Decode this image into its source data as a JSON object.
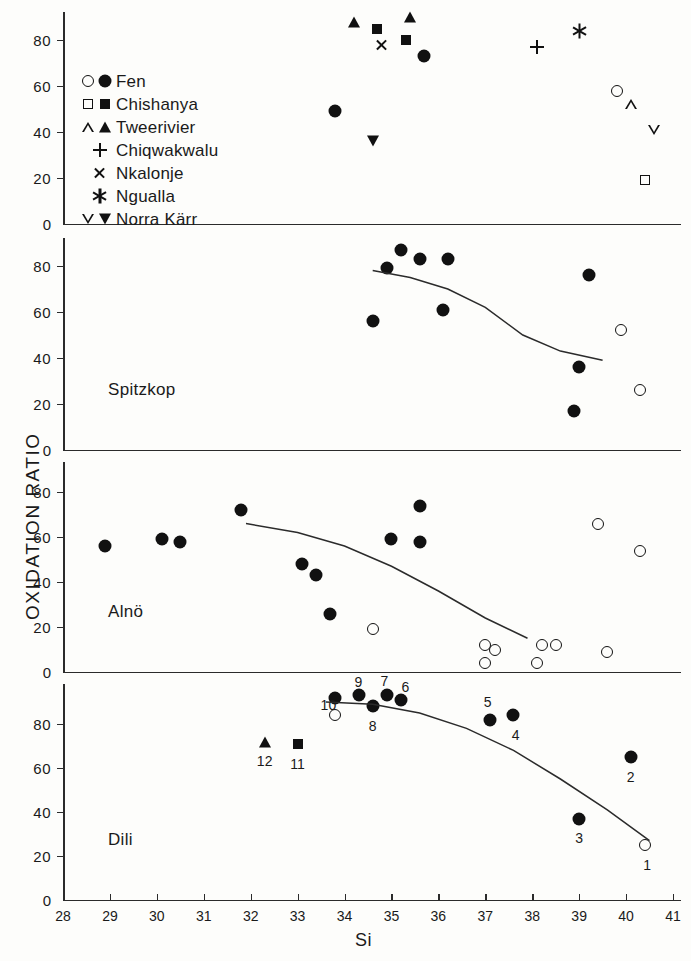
{
  "figure": {
    "axis_title_y": "OXIDATION  RATIO",
    "axis_title_x": "Si"
  },
  "legend": {
    "items": [
      {
        "label": "Fen",
        "markers": [
          "circle-open",
          "circle-filled"
        ]
      },
      {
        "label": "Chishanya",
        "markers": [
          "square-open",
          "square-filled"
        ]
      },
      {
        "label": "Tweerivier",
        "markers": [
          "triangle-open",
          "triangle-filled"
        ]
      },
      {
        "label": "Chiqwakwalu",
        "markers": [
          "plus"
        ]
      },
      {
        "label": "Nkalonje",
        "markers": [
          "x-cross"
        ]
      },
      {
        "label": "Ngualla",
        "markers": [
          "asterisk"
        ]
      },
      {
        "label": "Norra Kärr",
        "markers": [
          "dtriangle-open",
          "dtriangle-filled"
        ]
      }
    ]
  },
  "axes": {
    "x_ticks": [
      28,
      29,
      30,
      31,
      32,
      33,
      34,
      35,
      36,
      37,
      38,
      39,
      40,
      41
    ],
    "y_ticks": [
      0,
      20,
      40,
      60,
      80
    ],
    "xlim": [
      28,
      41
    ],
    "ylim": [
      0,
      95
    ]
  },
  "chart_data": {
    "type": "scatter",
    "title": "",
    "xlabel": "Si",
    "ylabel": "OXIDATION  RATIO",
    "xlim": [
      28,
      41
    ],
    "ylim": [
      0,
      95
    ],
    "grid": false,
    "legend_position": "top-left-panel",
    "panels": [
      {
        "name": "legend-panel",
        "label": "",
        "trend_curve": false,
        "points": [
          {
            "x": 34.2,
            "y": 88,
            "marker": "triangle-filled",
            "series": "Tweerivier"
          },
          {
            "x": 35.4,
            "y": 90,
            "marker": "triangle-filled",
            "series": "Tweerivier"
          },
          {
            "x": 34.7,
            "y": 85,
            "marker": "square-filled",
            "series": "Chishanya"
          },
          {
            "x": 35.3,
            "y": 80,
            "marker": "square-filled",
            "series": "Chishanya"
          },
          {
            "x": 34.8,
            "y": 78,
            "marker": "x-cross",
            "series": "Nkalonje"
          },
          {
            "x": 35.7,
            "y": 73,
            "marker": "circle-filled",
            "series": "Fen"
          },
          {
            "x": 33.8,
            "y": 49,
            "marker": "circle-filled",
            "series": "Fen"
          },
          {
            "x": 34.6,
            "y": 36,
            "marker": "dtriangle-filled",
            "series": "Norra Kärr"
          },
          {
            "x": 38.1,
            "y": 77,
            "marker": "plus",
            "series": "Chiqwakwalu"
          },
          {
            "x": 39.0,
            "y": 84,
            "marker": "asterisk",
            "series": "Ngualla"
          },
          {
            "x": 39.8,
            "y": 58,
            "marker": "circle-open",
            "series": "Fen"
          },
          {
            "x": 40.1,
            "y": 52,
            "marker": "triangle-open",
            "series": "Tweerivier"
          },
          {
            "x": 40.6,
            "y": 41,
            "marker": "dtriangle-open",
            "series": "Norra Kärr"
          },
          {
            "x": 40.4,
            "y": 19,
            "marker": "square-open",
            "series": "Chishanya"
          }
        ]
      },
      {
        "name": "spitzkop",
        "label": "Spitzkop",
        "trend_curve": true,
        "points": [
          {
            "x": 35.2,
            "y": 87,
            "marker": "circle-filled",
            "series": "Fen"
          },
          {
            "x": 35.6,
            "y": 83,
            "marker": "circle-filled",
            "series": "Fen"
          },
          {
            "x": 36.2,
            "y": 83,
            "marker": "circle-filled",
            "series": "Fen"
          },
          {
            "x": 34.9,
            "y": 79,
            "marker": "circle-filled",
            "series": "Fen"
          },
          {
            "x": 39.2,
            "y": 76,
            "marker": "circle-filled",
            "series": "Fen"
          },
          {
            "x": 36.1,
            "y": 61,
            "marker": "circle-filled",
            "series": "Fen"
          },
          {
            "x": 34.6,
            "y": 56,
            "marker": "circle-filled",
            "series": "Fen"
          },
          {
            "x": 39.9,
            "y": 52,
            "marker": "circle-open",
            "series": "Fen"
          },
          {
            "x": 39.0,
            "y": 36,
            "marker": "circle-filled",
            "series": "Fen"
          },
          {
            "x": 40.3,
            "y": 26,
            "marker": "circle-open",
            "series": "Fen"
          },
          {
            "x": 38.9,
            "y": 17,
            "marker": "circle-filled",
            "series": "Fen"
          }
        ]
      },
      {
        "name": "alno",
        "label": "Alnö",
        "trend_curve": true,
        "points": [
          {
            "x": 31.8,
            "y": 72,
            "marker": "circle-filled",
            "series": "Fen"
          },
          {
            "x": 35.6,
            "y": 74,
            "marker": "circle-filled",
            "series": "Fen"
          },
          {
            "x": 39.4,
            "y": 66,
            "marker": "circle-open",
            "series": "Fen"
          },
          {
            "x": 28.9,
            "y": 56,
            "marker": "circle-filled",
            "series": "Fen"
          },
          {
            "x": 30.1,
            "y": 59,
            "marker": "circle-filled",
            "series": "Fen"
          },
          {
            "x": 30.5,
            "y": 58,
            "marker": "circle-filled",
            "series": "Fen"
          },
          {
            "x": 35.0,
            "y": 59,
            "marker": "circle-filled",
            "series": "Fen"
          },
          {
            "x": 35.6,
            "y": 58,
            "marker": "circle-filled",
            "series": "Fen"
          },
          {
            "x": 40.3,
            "y": 54,
            "marker": "circle-open",
            "series": "Fen"
          },
          {
            "x": 33.1,
            "y": 48,
            "marker": "circle-filled",
            "series": "Fen"
          },
          {
            "x": 33.4,
            "y": 43,
            "marker": "circle-filled",
            "series": "Fen"
          },
          {
            "x": 33.7,
            "y": 26,
            "marker": "circle-filled",
            "series": "Fen"
          },
          {
            "x": 34.6,
            "y": 19,
            "marker": "circle-open",
            "series": "Fen"
          },
          {
            "x": 37.0,
            "y": 12,
            "marker": "circle-open",
            "series": "Fen"
          },
          {
            "x": 37.2,
            "y": 10,
            "marker": "circle-open",
            "series": "Fen"
          },
          {
            "x": 38.2,
            "y": 12,
            "marker": "circle-open",
            "series": "Fen"
          },
          {
            "x": 38.5,
            "y": 12,
            "marker": "circle-open",
            "series": "Fen"
          },
          {
            "x": 39.6,
            "y": 9,
            "marker": "circle-open",
            "series": "Fen"
          },
          {
            "x": 37.0,
            "y": 4,
            "marker": "circle-open",
            "series": "Fen"
          },
          {
            "x": 38.1,
            "y": 4,
            "marker": "circle-open",
            "series": "Fen"
          }
        ]
      },
      {
        "name": "dili",
        "label": "Dili",
        "trend_curve": true,
        "points": [
          {
            "x": 33.8,
            "y": 92,
            "marker": "circle-filled",
            "series": "Fen",
            "number": "10"
          },
          {
            "x": 34.3,
            "y": 93,
            "marker": "circle-filled",
            "series": "Fen",
            "number": "9"
          },
          {
            "x": 34.9,
            "y": 93,
            "marker": "circle-filled",
            "series": "Fen",
            "number": "7"
          },
          {
            "x": 35.2,
            "y": 91,
            "marker": "circle-filled",
            "series": "Fen",
            "number": "6"
          },
          {
            "x": 34.6,
            "y": 88,
            "marker": "circle-filled",
            "series": "Fen",
            "number": "8"
          },
          {
            "x": 33.8,
            "y": 84,
            "marker": "circle-open",
            "series": "Fen",
            "number": "10"
          },
          {
            "x": 37.1,
            "y": 82,
            "marker": "circle-filled",
            "series": "Fen",
            "number": "5"
          },
          {
            "x": 37.6,
            "y": 84,
            "marker": "circle-filled",
            "series": "Fen",
            "number": "4"
          },
          {
            "x": 32.3,
            "y": 72,
            "marker": "triangle-filled",
            "series": "Tweerivier",
            "number": "12"
          },
          {
            "x": 33.0,
            "y": 71,
            "marker": "square-filled",
            "series": "Chishanya",
            "number": "11"
          },
          {
            "x": 40.1,
            "y": 65,
            "marker": "circle-filled",
            "series": "Fen",
            "number": "2"
          },
          {
            "x": 39.0,
            "y": 37,
            "marker": "circle-filled",
            "series": "Fen",
            "number": "3"
          },
          {
            "x": 40.4,
            "y": 25,
            "marker": "circle-open",
            "series": "Fen",
            "number": "1"
          }
        ]
      }
    ],
    "point_number_labels": {
      "1": {
        "panel": "dili",
        "x": 40.4,
        "y": 25
      },
      "2": {
        "panel": "dili",
        "x": 40.1,
        "y": 65
      },
      "3": {
        "panel": "dili",
        "x": 39.0,
        "y": 37
      },
      "4": {
        "panel": "dili",
        "x": 37.6,
        "y": 84
      },
      "5": {
        "panel": "dili",
        "x": 37.1,
        "y": 82
      },
      "6": {
        "panel": "dili",
        "x": 35.2,
        "y": 91
      },
      "7": {
        "panel": "dili",
        "x": 34.9,
        "y": 93
      },
      "8": {
        "panel": "dili",
        "x": 34.6,
        "y": 88
      },
      "9": {
        "panel": "dili",
        "x": 34.3,
        "y": 93
      },
      "10": {
        "panel": "dili",
        "x": 33.8,
        "y": 84
      },
      "11": {
        "panel": "dili",
        "x": 33.0,
        "y": 71
      },
      "12": {
        "panel": "dili",
        "x": 32.3,
        "y": 72
      }
    }
  }
}
